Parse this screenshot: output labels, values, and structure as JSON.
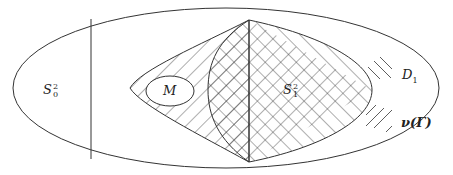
{
  "diagram": {
    "labels": {
      "s0": {
        "base": "S",
        "sup": "2",
        "sub": "0"
      },
      "s1": {
        "base": "S",
        "sup": "2",
        "sub": "1"
      },
      "m": "M"
    },
    "legend": [
      {
        "pattern": "backslash-hatch",
        "label_base": "D",
        "label_sub": "1"
      },
      {
        "pattern": "slash-hatch",
        "label": "ν(Γ)"
      }
    ],
    "colors": {
      "stroke": "#333333",
      "background": "#ffffff"
    }
  }
}
